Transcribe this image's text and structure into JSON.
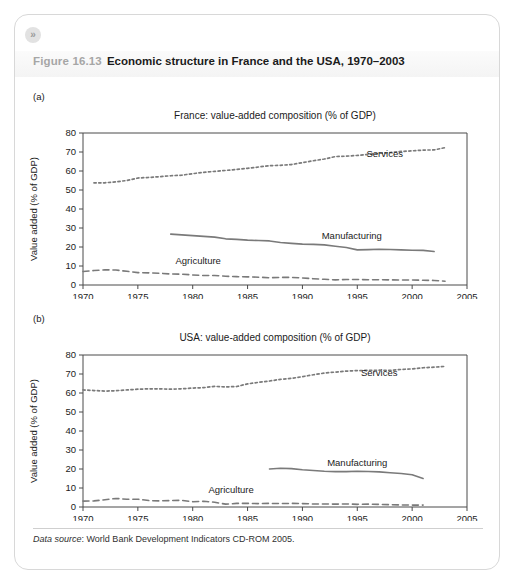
{
  "card": {
    "expand_icon": "»",
    "figure_number": "Figure 16.13",
    "figure_title": "Economic structure in France and the USA, 1970–2003",
    "source_label": "Data source",
    "source_text": ": World Bank Development Indicators CD-ROM 2005.",
    "panel_a_tag": "(a)",
    "panel_b_tag": "(b)"
  },
  "style": {
    "line_color": "#7a7a7a",
    "axis_color": "#4a4a4a",
    "band_color": "#f4f4f4",
    "title_gray": "#a6a6a6",
    "text_dark": "#1b1b1b"
  },
  "chart_data": [
    {
      "type": "line",
      "panel": "(a)",
      "title": "France: value-added composition (% of GDP)",
      "xlabel": "",
      "ylabel": "Value added (% of GDP)",
      "xlim": [
        1970,
        2005
      ],
      "ylim": [
        0,
        80
      ],
      "xticks": [
        1970,
        1975,
        1980,
        1985,
        1990,
        1995,
        2000,
        2005
      ],
      "yticks": [
        0,
        10,
        20,
        30,
        40,
        50,
        60,
        70,
        80
      ],
      "grid": false,
      "legend": "inline-annotations",
      "series": [
        {
          "name": "Services",
          "style": "dotted",
          "label_x": 1997.5,
          "label_y": 67.5,
          "x": [
            1971,
            1972,
            1973,
            1974,
            1975,
            1976,
            1977,
            1978,
            1979,
            1980,
            1981,
            1982,
            1983,
            1984,
            1985,
            1986,
            1987,
            1988,
            1989,
            1990,
            1991,
            1992,
            1993,
            1994,
            1995,
            1996,
            1997,
            1998,
            1999,
            2000,
            2001,
            2002,
            2003
          ],
          "values": [
            53.8,
            53.8,
            54.3,
            55.0,
            56.3,
            56.6,
            57.0,
            57.5,
            57.8,
            58.6,
            59.3,
            59.8,
            60.3,
            60.8,
            61.4,
            62.1,
            62.8,
            63.0,
            63.4,
            64.4,
            65.4,
            66.3,
            67.6,
            67.8,
            68.2,
            68.8,
            69.3,
            69.7,
            70.3,
            70.6,
            71.0,
            71.1,
            72.3
          ]
        },
        {
          "name": "Manufacturing",
          "style": "solid",
          "label_x": 1994.5,
          "label_y": 24.0,
          "x": [
            1978,
            1979,
            1980,
            1981,
            1982,
            1983,
            1984,
            1985,
            1986,
            1987,
            1988,
            1989,
            1990,
            1991,
            1992,
            1993,
            1994,
            1995,
            1996,
            1997,
            1998,
            1999,
            2000,
            2001,
            2002
          ],
          "values": [
            26.8,
            26.4,
            26.0,
            25.6,
            25.2,
            24.3,
            24.0,
            23.6,
            23.4,
            23.2,
            22.4,
            21.9,
            21.5,
            21.4,
            21.1,
            20.4,
            19.7,
            18.5,
            18.6,
            18.8,
            18.7,
            18.5,
            18.3,
            18.2,
            17.6
          ]
        },
        {
          "name": "Agriculture",
          "style": "dashed",
          "label_x": 1980.5,
          "label_y": 11.0,
          "x": [
            1970,
            1971,
            1972,
            1973,
            1974,
            1975,
            1976,
            1977,
            1978,
            1979,
            1980,
            1981,
            1982,
            1983,
            1984,
            1985,
            1986,
            1987,
            1988,
            1989,
            1990,
            1991,
            1992,
            1993,
            1994,
            1995,
            1996,
            1997,
            1998,
            1999,
            2000,
            2001,
            2002,
            2003
          ],
          "values": [
            7.1,
            7.6,
            8.0,
            7.9,
            7.2,
            6.5,
            6.4,
            6.2,
            5.8,
            5.7,
            5.3,
            5.0,
            5.0,
            4.6,
            4.4,
            4.3,
            4.1,
            3.8,
            4.0,
            4.0,
            3.7,
            3.3,
            3.0,
            2.7,
            2.9,
            2.9,
            2.8,
            2.8,
            2.7,
            2.6,
            2.6,
            2.5,
            2.4,
            2.0
          ]
        }
      ]
    },
    {
      "type": "line",
      "panel": "(b)",
      "title": "USA: value-added composition (% of GDP)",
      "xlabel": "",
      "ylabel": "Value added (% of GDP)",
      "xlim": [
        1970,
        2005
      ],
      "ylim": [
        0,
        80
      ],
      "xticks": [
        1970,
        1975,
        1980,
        1985,
        1990,
        1995,
        2000,
        2005
      ],
      "yticks": [
        0,
        10,
        20,
        30,
        40,
        50,
        60,
        70,
        80
      ],
      "grid": false,
      "legend": "inline-annotations",
      "series": [
        {
          "name": "Services",
          "style": "dotted",
          "label_x": 1997.0,
          "label_y": 69.0,
          "x": [
            1970,
            1971,
            1972,
            1973,
            1974,
            1975,
            1976,
            1977,
            1978,
            1979,
            1980,
            1981,
            1982,
            1983,
            1984,
            1985,
            1986,
            1987,
            1988,
            1989,
            1990,
            1991,
            1992,
            1993,
            1994,
            1995,
            1996,
            1997,
            1998,
            1999,
            2000,
            2001,
            2002,
            2003
          ],
          "values": [
            61.6,
            61.3,
            61.0,
            61.2,
            61.6,
            62.0,
            62.2,
            62.2,
            62.0,
            62.2,
            62.6,
            62.8,
            63.5,
            63.2,
            63.4,
            64.8,
            65.6,
            66.3,
            67.2,
            67.7,
            68.6,
            69.6,
            70.5,
            71.0,
            71.5,
            71.8,
            71.9,
            72.0,
            71.9,
            72.4,
            72.7,
            73.3,
            73.6,
            74.0
          ]
        },
        {
          "name": "Manufacturing",
          "style": "solid",
          "label_x": 1995.0,
          "label_y": 21.5,
          "x": [
            1987,
            1988,
            1989,
            1990,
            1991,
            1992,
            1993,
            1994,
            1995,
            1996,
            1997,
            1998,
            1999,
            2000,
            2001
          ],
          "values": [
            20.0,
            20.4,
            20.2,
            19.6,
            19.2,
            18.8,
            18.6,
            18.6,
            18.8,
            18.7,
            18.5,
            18.0,
            17.6,
            17.0,
            15.0
          ]
        },
        {
          "name": "Agriculture",
          "style": "dashed",
          "label_x": 1983.5,
          "label_y": 7.5,
          "x": [
            1970,
            1971,
            1972,
            1973,
            1974,
            1975,
            1976,
            1977,
            1978,
            1979,
            1980,
            1981,
            1982,
            1983,
            1984,
            1985,
            1986,
            1987,
            1988,
            1989,
            1990,
            1991,
            1992,
            1993,
            1994,
            1995,
            1996,
            1997,
            1998,
            1999,
            2000,
            2001
          ],
          "values": [
            3.1,
            3.2,
            3.8,
            4.5,
            4.1,
            4.1,
            3.4,
            3.2,
            3.4,
            3.5,
            2.8,
            3.0,
            2.5,
            1.5,
            1.9,
            1.9,
            1.8,
            1.9,
            1.8,
            1.9,
            1.8,
            1.6,
            1.6,
            1.5,
            1.6,
            1.4,
            1.5,
            1.4,
            1.2,
            1.1,
            1.0,
            1.0
          ]
        }
      ]
    }
  ]
}
